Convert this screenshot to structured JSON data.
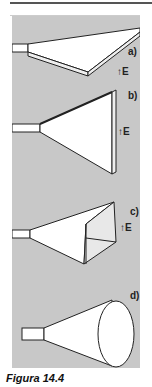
{
  "figure": {
    "caption": "Figura 14.4",
    "panels": [
      {
        "id": "a",
        "label": "a)",
        "field_label": "E",
        "shape": "sectoral-horn-E-plane-flat"
      },
      {
        "id": "b",
        "label": "b)",
        "field_label": "E",
        "shape": "sectoral-horn-H-plane"
      },
      {
        "id": "c",
        "label": "c)",
        "field_label": "E",
        "shape": "pyramidal-horn"
      },
      {
        "id": "d",
        "label": "d)",
        "shape": "conical-horn"
      }
    ],
    "colors": {
      "panel_background": "#c8c8c8",
      "shape_fill": "#ffffff",
      "line": "#222222"
    }
  }
}
